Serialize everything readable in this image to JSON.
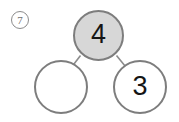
{
  "worksheet": {
    "problem_number": "7",
    "problem_number_style": "circled",
    "type": "number-bond"
  },
  "colors": {
    "total_fill": "#d7d7d7",
    "part_fill": "#ffffff",
    "stroke": "#7d7d7d",
    "connector": "#8c8c8c",
    "text": "#151515",
    "problem_number_text": "#6e6e6e",
    "background": "#ffffff"
  },
  "number_bond": {
    "total": {
      "label": "whole",
      "value": "4",
      "filled": true
    },
    "parts": [
      {
        "label": "part-left",
        "value": "",
        "filled": false,
        "blank": true
      },
      {
        "label": "part-right",
        "value": "3",
        "filled": false,
        "blank": false
      }
    ],
    "connectors": [
      {
        "from": "total",
        "to": "part-left"
      },
      {
        "from": "total",
        "to": "part-right"
      }
    ]
  }
}
